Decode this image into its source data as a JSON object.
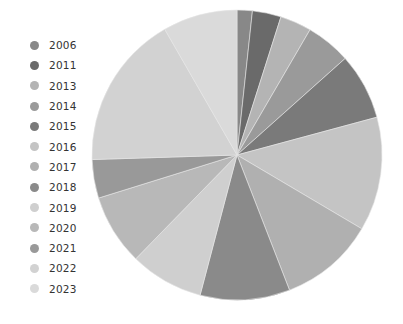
{
  "chart_data": {
    "type": "pie",
    "title": "",
    "legend_position": "left",
    "categories": [
      "2006",
      "2011",
      "2013",
      "2014",
      "2015",
      "2016",
      "2017",
      "2018",
      "2019",
      "2020",
      "2021",
      "2022",
      "2023"
    ],
    "values": [
      1.7,
      3.2,
      3.5,
      5.0,
      7.4,
      12.7,
      10.6,
      10.0,
      8.2,
      7.9,
      4.3,
      17.2,
      8.3
    ],
    "colors": [
      "#888888",
      "#6a6a6a",
      "#b4b4b4",
      "#9a9a9a",
      "#7a7a7a",
      "#c4c4c4",
      "#b0b0b0",
      "#8a8a8a",
      "#cfcfcf",
      "#b8b8b8",
      "#999999",
      "#d2d2d2",
      "#dadada"
    ],
    "start_angle_deg": 0,
    "direction": "clockwise",
    "center": [
      237,
      155
    ],
    "radius": 145
  },
  "legend": {
    "items": [
      {
        "label": "2006",
        "color": "#888888"
      },
      {
        "label": "2011",
        "color": "#6a6a6a"
      },
      {
        "label": "2013",
        "color": "#b4b4b4"
      },
      {
        "label": "2014",
        "color": "#9a9a9a"
      },
      {
        "label": "2015",
        "color": "#7a7a7a"
      },
      {
        "label": "2016",
        "color": "#c4c4c4"
      },
      {
        "label": "2017",
        "color": "#b0b0b0"
      },
      {
        "label": "2018",
        "color": "#8a8a8a"
      },
      {
        "label": "2019",
        "color": "#cfcfcf"
      },
      {
        "label": "2020",
        "color": "#b8b8b8"
      },
      {
        "label": "2021",
        "color": "#999999"
      },
      {
        "label": "2022",
        "color": "#d2d2d2"
      },
      {
        "label": "2023",
        "color": "#dadada"
      }
    ]
  }
}
